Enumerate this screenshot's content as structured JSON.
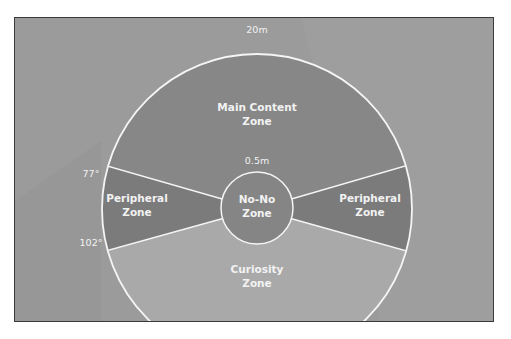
{
  "diagram": {
    "colors": {
      "background": "#9b9b9b",
      "main_zone": "#878787",
      "peripheral_zone": "#7b7b7b",
      "curiosity_zone": "#a9a9a9",
      "no_no_zone": "#858585",
      "lines": "#f5f5f5",
      "text": "#f2f2f2"
    },
    "labels": {
      "outer_radius": "20m",
      "inner_radius": "0.5m",
      "angle_top": "77°",
      "angle_bottom": "102°"
    },
    "zones": {
      "main": [
        "Main Content",
        "Zone"
      ],
      "peripheral_left": [
        "Peripheral",
        "Zone"
      ],
      "peripheral_right": [
        "Peripheral",
        "Zone"
      ],
      "no_no": [
        "No-No",
        "Zone"
      ],
      "curiosity": [
        "Curiosity",
        "Zone"
      ]
    }
  }
}
